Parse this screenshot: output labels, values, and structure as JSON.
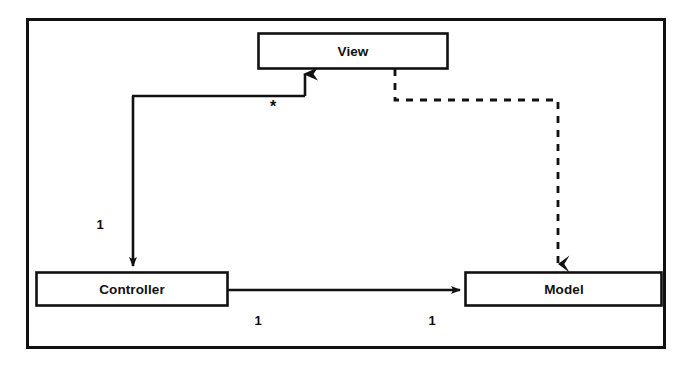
{
  "diagram": {
    "type": "uml-class-diagram",
    "canvas": {
      "width": 692,
      "height": 366
    },
    "colors": {
      "background": "#ffffff",
      "stroke": "#111111",
      "node_fill": "#ffffff",
      "text": "#111111"
    },
    "frame": {
      "name": "diagram-frame",
      "x": 26,
      "y": 18,
      "width": 639,
      "height": 330,
      "stroke_width": 3
    },
    "nodes": [
      {
        "id": "view",
        "label": "View",
        "x": 258,
        "y": 33,
        "width": 190,
        "height": 36
      },
      {
        "id": "controller",
        "label": "Controller",
        "x": 36,
        "y": 272,
        "width": 192,
        "height": 34
      },
      {
        "id": "model",
        "label": "Model",
        "x": 465,
        "y": 272,
        "width": 197,
        "height": 34
      }
    ],
    "edges": [
      {
        "id": "view-to-controller",
        "from": "view",
        "to": "controller",
        "style": "solid",
        "arrowhead": "open-solid",
        "description": "View has one Controller; Controller is associated with many Views"
      },
      {
        "id": "controller-to-model",
        "from": "controller",
        "to": "model",
        "style": "solid",
        "arrowhead": "filled",
        "description": "Controller references Model"
      },
      {
        "id": "view-to-model-dependency",
        "from": "view",
        "to": "model",
        "style": "dashed",
        "arrowhead": "open-v",
        "description": "View depends on Model"
      }
    ],
    "multiplicity_labels": [
      {
        "id": "view-end-star",
        "text": "*",
        "x": 273,
        "y": 107
      },
      {
        "id": "controller-end-one",
        "text": "1",
        "x": 100,
        "y": 226
      },
      {
        "id": "controller-model-source-one",
        "text": "1",
        "x": 258,
        "y": 322
      },
      {
        "id": "controller-model-target-one",
        "text": "1",
        "x": 432,
        "y": 322
      }
    ]
  }
}
